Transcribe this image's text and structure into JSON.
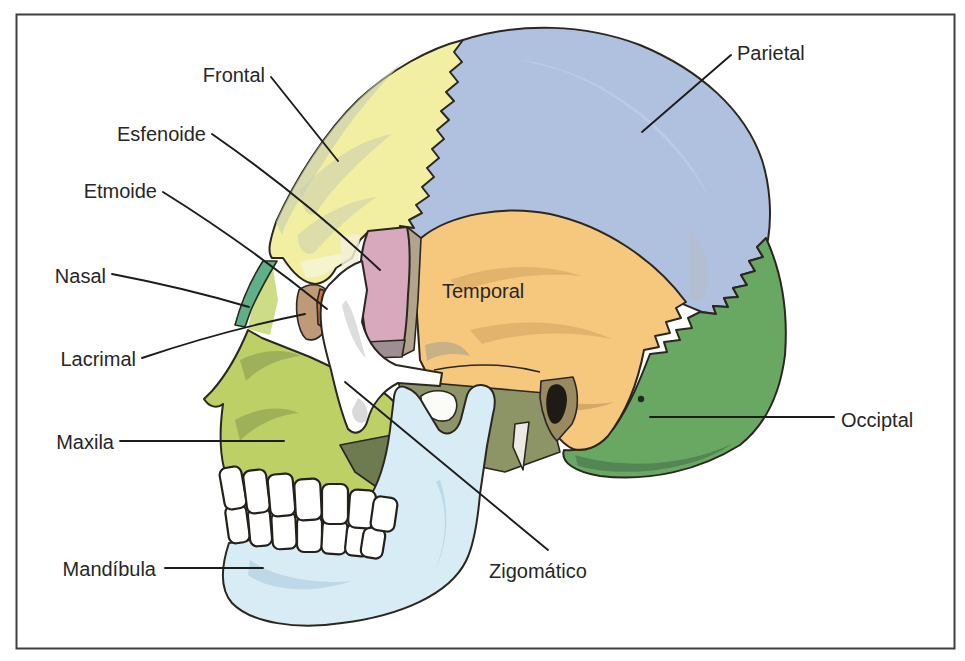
{
  "bones": [
    {
      "id": "frontal",
      "label": "Frontal",
      "color": "#f3efa2"
    },
    {
      "id": "parietal",
      "label": "Parietal",
      "color": "#b0c1e0"
    },
    {
      "id": "temporal",
      "label": "Temporal",
      "color": "#f6c87e"
    },
    {
      "id": "occipital",
      "label": "Occiptal",
      "color": "#69a862"
    },
    {
      "id": "esfenoide",
      "label": "Esfenoide",
      "color": "#d8a8bc"
    },
    {
      "id": "etmoide",
      "label": "Etmoide",
      "color": "#cb7340"
    },
    {
      "id": "nasal",
      "label": "Nasal",
      "color": "#5fb089"
    },
    {
      "id": "lacrimal",
      "label": "Lacrimal",
      "color": "#bf9a78"
    },
    {
      "id": "maxila",
      "label": "Maxila",
      "color": "#bdd066"
    },
    {
      "id": "mandibula",
      "label": "Mandíbula",
      "color": "#d8ecf6"
    },
    {
      "id": "zigomatico",
      "label": "Zigomático",
      "color": "#ffffff"
    }
  ],
  "colors": {
    "background": "#ffffff",
    "border": "#3f3f3f",
    "outline": "#2b2620",
    "leader_line": "#1c1c1c",
    "label_text": "#272727",
    "teeth": "#ffffff",
    "ear_canal": "#1e1b17",
    "infratemporal_olive": "#8d9566",
    "infratemporal_dark_olive": "#6e7a50",
    "sphenoid_base_gray": "#9d8e93",
    "temporal_gray_band": "#b2a48a",
    "maxilla_process_green": "#cddd85",
    "styloid_white": "#eceae2",
    "notch_white": "#fbfbf8",
    "ear_rim_tan": "#9a8a62"
  }
}
